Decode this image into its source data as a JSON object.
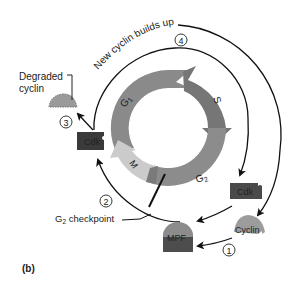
{
  "figure": {
    "panel_label": "(b)",
    "phases": {
      "g1": "G",
      "g1_sub": "1",
      "s": "S",
      "g2": "G",
      "g2_sub": "2",
      "m": "M"
    },
    "labels": {
      "new_cyclin": "New cyclin builds up",
      "degraded_cyclin_line1": "Degraded",
      "degraded_cyclin_line2": "cyclin",
      "checkpoint_main": "G",
      "checkpoint_sub": "2",
      "checkpoint_rest": " checkpoint",
      "cdk_top": "Cdk",
      "cdk_right": "Cdk",
      "cyclin": "Cyclin",
      "mpf": "MPF"
    },
    "steps": [
      "1",
      "2",
      "3",
      "4"
    ],
    "colors": {
      "ring_g1": "#8a8a8a",
      "ring_s": "#7a7a7a",
      "ring_g2": "#8c8c8c",
      "ring_m": "#c9c9c9",
      "cdk_fill": "#3a3a3a",
      "cyclin_fill": "#9a9a9a",
      "mpf_top": "#8c8c8c",
      "mpf_bottom": "#4a4a4a",
      "line": "#111111"
    }
  }
}
